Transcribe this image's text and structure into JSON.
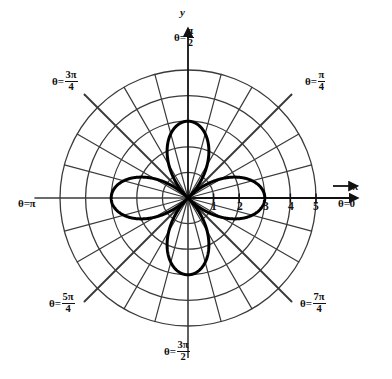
{
  "figure": {
    "kind": "polar-plot",
    "background_color": "#ffffff",
    "ink_color": "#111111",
    "grid_color": "#3a3a3a",
    "curve_color": "#000000"
  },
  "axes": {
    "x_axis_label": "x",
    "y_axis_label": "y",
    "x_tick_labels": [
      "1",
      "2",
      "3",
      "4",
      "5"
    ],
    "x_tick_values": [
      1,
      2,
      3,
      4,
      5
    ]
  },
  "angle_labels": [
    {
      "id": "theta-0",
      "text_theta": "θ",
      "eq": "=",
      "value": "0",
      "kind": "plain",
      "numerator": "",
      "denominator": ""
    },
    {
      "id": "theta-pi-4",
      "text_theta": "θ",
      "eq": "=",
      "value": "",
      "kind": "frac",
      "numerator": "π",
      "denominator": "4"
    },
    {
      "id": "theta-pi-2",
      "text_theta": "θ",
      "eq": "=",
      "value": "",
      "kind": "frac",
      "numerator": "π",
      "denominator": "2"
    },
    {
      "id": "theta-3pi-4",
      "text_theta": "θ",
      "eq": "=",
      "value": "",
      "kind": "frac",
      "numerator": "3π",
      "denominator": "4"
    },
    {
      "id": "theta-pi",
      "text_theta": "θ",
      "eq": "=",
      "value": "π",
      "kind": "plain",
      "numerator": "",
      "denominator": ""
    },
    {
      "id": "theta-5pi-4",
      "text_theta": "θ",
      "eq": "=",
      "value": "",
      "kind": "frac",
      "numerator": "5π",
      "denominator": "4"
    },
    {
      "id": "theta-3pi-2",
      "text_theta": "θ",
      "eq": "=",
      "value": "",
      "kind": "frac",
      "numerator": "3π",
      "denominator": "2"
    },
    {
      "id": "theta-7pi-4",
      "text_theta": "θ",
      "eq": "=",
      "value": "",
      "kind": "frac",
      "numerator": "7π",
      "denominator": "4"
    }
  ],
  "chart_data": {
    "type": "line",
    "coordinate_system": "polar",
    "title": "",
    "subtitle": "",
    "xlabel": "x",
    "ylabel": "y",
    "legend": [],
    "grid": true,
    "grid_radial_rings": [
      1,
      2,
      3,
      4,
      5
    ],
    "grid_angular_spacing_deg": 15,
    "grid_major_spokes_deg": [
      0,
      45,
      90,
      135,
      180,
      225,
      270,
      315
    ],
    "rlim": [
      0,
      5
    ],
    "r_tick_labels": [
      "1",
      "2",
      "3",
      "4",
      "5"
    ],
    "theta_tick_labels": [
      "θ = 0",
      "θ = π/4",
      "θ = π/2",
      "θ = 3π/4",
      "θ = π",
      "θ = 5π/4",
      "θ = 3π/2",
      "θ = 7π/4"
    ],
    "series": [
      {
        "name": "four-petal rose",
        "equation": "r = 3 cos(2θ)",
        "amplitude": 3,
        "petal_count": 4,
        "petal_tip_radius": 3,
        "petal_tip_angles_deg": [
          0,
          90,
          180,
          270
        ],
        "line_width": 3,
        "color": "#000000"
      }
    ],
    "annotations": []
  }
}
